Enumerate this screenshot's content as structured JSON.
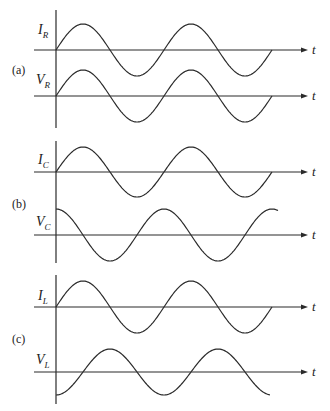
{
  "figure": {
    "panels": [
      {
        "label": "(a)",
        "element": "Resistor",
        "vertical_axis": {
          "x": 56,
          "y_top": 10,
          "y_bottom": 128
        },
        "label_pos": {
          "x": 12,
          "y": 74
        },
        "traces": [
          {
            "name": "I",
            "subscript": "R",
            "axis_y": 50,
            "amplitude": 26,
            "phase": "sin",
            "x_start": 56,
            "x_end": 272,
            "label_x": 38,
            "label_y": 34,
            "t_label": "t"
          },
          {
            "name": "V",
            "subscript": "R",
            "axis_y": 96,
            "amplitude": 26,
            "phase": "sin",
            "x_start": 56,
            "x_end": 272,
            "label_x": 36,
            "label_y": 84,
            "t_label": "t"
          }
        ]
      },
      {
        "label": "(b)",
        "element": "Capacitor",
        "vertical_axis": {
          "x": 56,
          "y_top": 141,
          "y_bottom": 263
        },
        "label_pos": {
          "x": 12,
          "y": 208
        },
        "traces": [
          {
            "name": "I",
            "subscript": "C",
            "axis_y": 172,
            "amplitude": 25,
            "phase": "sin",
            "x_start": 56,
            "x_end": 272,
            "label_x": 38,
            "label_y": 164,
            "t_label": "t"
          },
          {
            "name": "V",
            "subscript": "C",
            "axis_y": 235,
            "amplitude": 26,
            "phase": "cos",
            "x_start": 56,
            "x_end": 278,
            "label_x": 36,
            "label_y": 226,
            "t_label": "t"
          }
        ]
      },
      {
        "label": "(c)",
        "element": "Inductor",
        "vertical_axis": {
          "x": 56,
          "y_top": 275,
          "y_bottom": 404
        },
        "label_pos": {
          "x": 12,
          "y": 343
        },
        "traces": [
          {
            "name": "I",
            "subscript": "L",
            "axis_y": 307,
            "amplitude": 26,
            "phase": "sin",
            "x_start": 56,
            "x_end": 272,
            "label_x": 38,
            "label_y": 300,
            "t_label": "t"
          },
          {
            "name": "V",
            "subscript": "L",
            "axis_y": 372,
            "amplitude": 23,
            "phase": "-cos",
            "x_start": 56,
            "x_end": 270,
            "label_x": 36,
            "label_y": 364,
            "t_label": "t"
          }
        ]
      }
    ],
    "period_px": 108,
    "axis_x_start": 34,
    "axis_x_end": 308,
    "t_label_x": 312
  }
}
